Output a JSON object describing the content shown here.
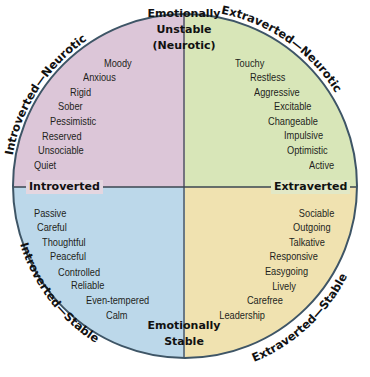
{
  "diagram": {
    "axes": {
      "top": [
        "Emotionally",
        "Unstable",
        "(Neurotic)"
      ],
      "bottom": [
        "Emotionally",
        "Stable"
      ],
      "left": "Introverted",
      "right": "Extraverted"
    },
    "quadrant_labels": {
      "top_left": "Introverted—Neurotic",
      "top_right": "Extraverted—Neurotic",
      "bottom_left": "Introverted—Stable",
      "bottom_right": "Extraverted—Stable"
    },
    "quadrants": {
      "introverted_neurotic": {
        "color": "#dcc6d8",
        "traits": [
          "Moody",
          "Anxious",
          "Rigid",
          "Sober",
          "Pessimistic",
          "Reserved",
          "Unsociable",
          "Quiet"
        ]
      },
      "extraverted_neurotic": {
        "color": "#d8e6b8",
        "traits": [
          "Touchy",
          "Restless",
          "Aggressive",
          "Excitable",
          "Changeable",
          "Impulsive",
          "Optimistic",
          "Active"
        ]
      },
      "introverted_stable": {
        "color": "#bcd8ea",
        "traits": [
          "Passive",
          "Careful",
          "Thoughtful",
          "Peaceful",
          "Controlled",
          "Reliable",
          "Even-tempered",
          "Calm"
        ]
      },
      "extraverted_stable": {
        "color": "#f0e2b0",
        "traits": [
          "Sociable",
          "Outgoing",
          "Talkative",
          "Responsive",
          "Easygoing",
          "Lively",
          "Carefree",
          "Leadership"
        ]
      }
    }
  }
}
